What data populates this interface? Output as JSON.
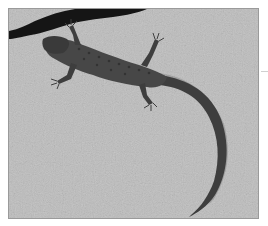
{
  "image": {
    "subject": "lizard on rock",
    "palette": {
      "rock_light": "#c8c8c8",
      "rock_mid": "#b0b0b0",
      "crack": "#111111",
      "lizard_body": "#4a4a4a",
      "lizard_dark": "#2a2a2a",
      "border": "#9a9a9a",
      "background": "#ffffff"
    }
  }
}
